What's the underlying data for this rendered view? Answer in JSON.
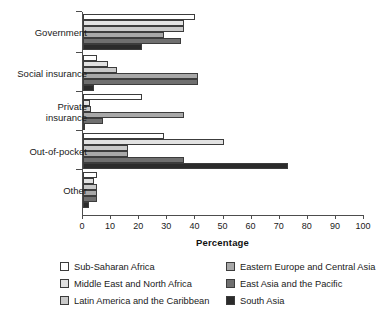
{
  "chart_data": {
    "type": "bar",
    "orientation": "horizontal",
    "title": "",
    "xlabel": "Percentage",
    "ylabel": "",
    "xlim": [
      0,
      100
    ],
    "xticks": [
      0,
      10,
      20,
      30,
      40,
      50,
      60,
      70,
      80,
      90,
      100
    ],
    "grid": false,
    "legend_position": "bottom",
    "categories": [
      "Government",
      "Social insurance",
      "Private\ninsurance",
      "Out-of-pocket",
      "Other"
    ],
    "series": [
      {
        "name": "Sub-Saharan Africa",
        "color": "#ffffff",
        "values": [
          40,
          5,
          21,
          29,
          5
        ]
      },
      {
        "name": "Middle East and North Africa",
        "color": "#e2e2e2",
        "values": [
          36,
          9,
          2.5,
          50,
          4
        ]
      },
      {
        "name": "Latin America and the Caribbean",
        "color": "#c9c9c9",
        "values": [
          36,
          12,
          3,
          16,
          5
        ]
      },
      {
        "name": "Eastern Europe and Central Asia",
        "color": "#a8a8a8",
        "values": [
          29,
          41,
          36,
          16,
          5
        ]
      },
      {
        "name": "East Asia and the Pacific",
        "color": "#6f6f6f",
        "values": [
          35,
          41,
          7,
          36,
          5
        ]
      },
      {
        "name": "South Asia",
        "color": "#2b2b2b",
        "values": [
          21,
          4,
          0,
          73,
          2
        ]
      }
    ]
  },
  "axis": {
    "tick_labels": [
      "0",
      "10",
      "20",
      "30",
      "40",
      "50",
      "60",
      "70",
      "80",
      "90",
      "100"
    ],
    "title": "Percentage"
  },
  "legend": {
    "items": [
      {
        "label": "Sub-Saharan Africa",
        "swatch": "swatch-sub-saharan-africa"
      },
      {
        "label": "Eastern Europe and Central Asia",
        "swatch": "swatch-eastern-europe-central-asia"
      },
      {
        "label": "Middle East and North Africa",
        "swatch": "swatch-middle-east-north-africa"
      },
      {
        "label": "East Asia and the Pacific",
        "swatch": "swatch-east-asia-pacific"
      },
      {
        "label": "Latin America and the Caribbean",
        "swatch": "swatch-latin-america-caribbean"
      },
      {
        "label": "South Asia",
        "swatch": "swatch-south-asia"
      }
    ]
  }
}
